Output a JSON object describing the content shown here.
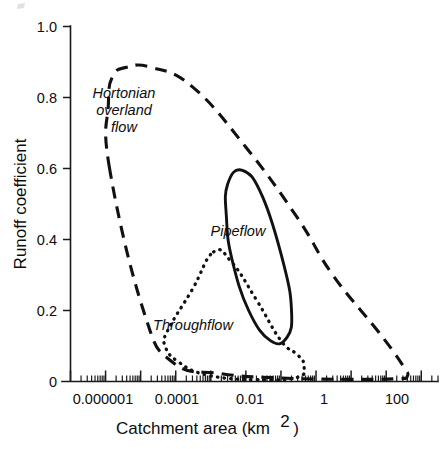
{
  "chart_data": {
    "type": "line",
    "title": "",
    "xlabel": "Catchment area (km2)",
    "xlabel_base": "Catchment area (km",
    "xlabel_sup": "2",
    "xlabel_close": ")",
    "ylabel": "Runoff coefficient",
    "xscale": "log",
    "yscale": "linear",
    "xlim": [
      1e-07,
      3000
    ],
    "ylim": [
      0,
      1.0
    ],
    "grid": false,
    "legend_position": "inline-annotations",
    "xticklabels": [
      "0.000001",
      "0.0001",
      "0.01",
      "1",
      "100"
    ],
    "xtickvalues": [
      1e-06,
      0.0001,
      0.01,
      1,
      100
    ],
    "yticklabels": [
      "1.0",
      "0.8",
      "0.6",
      "0.4",
      "0.2",
      "0"
    ],
    "ytickvalues": [
      1.0,
      0.8,
      0.6,
      0.4,
      0.2,
      0
    ],
    "series": [
      {
        "name": "Hortonian overland flow",
        "linestyle": "dashed",
        "label_lines": [
          "Hortonian",
          "overland",
          "flow"
        ],
        "envelope_points": [
          [
            1.3e-06,
            0.6
          ],
          [
            1.2e-06,
            0.78
          ],
          [
            1.6e-06,
            0.86
          ],
          [
            4e-06,
            0.885
          ],
          [
            2e-05,
            0.885
          ],
          [
            0.0003,
            0.83
          ],
          [
            0.01,
            0.66
          ],
          [
            0.3,
            0.46
          ],
          [
            3.0,
            0.3
          ],
          [
            60,
            0.14
          ],
          [
            300,
            0.045
          ],
          [
            400,
            0.015
          ],
          [
            200,
            0.008
          ],
          [
            10,
            0.006
          ],
          [
            0.1,
            0.01
          ],
          [
            0.002,
            0.022
          ],
          [
            8e-05,
            0.055
          ],
          [
            1.2e-05,
            0.2
          ],
          [
            1.3e-06,
            0.6
          ]
        ]
      },
      {
        "name": "Pipeflow",
        "linestyle": "solid",
        "label_lines": [
          "Pipeflow"
        ],
        "envelope_points": [
          [
            0.003,
            0.555
          ],
          [
            0.008,
            0.595
          ],
          [
            0.03,
            0.52
          ],
          [
            0.12,
            0.33
          ],
          [
            0.2,
            0.2
          ],
          [
            0.15,
            0.125
          ],
          [
            0.05,
            0.115
          ],
          [
            0.012,
            0.2
          ],
          [
            0.004,
            0.345
          ],
          [
            0.0028,
            0.46
          ],
          [
            0.003,
            0.555
          ]
        ]
      },
      {
        "name": "Throughflow",
        "linestyle": "dotted",
        "label_lines": [
          "Throughflow"
        ],
        "envelope_points": [
          [
            0.0012,
            0.365
          ],
          [
            0.004,
            0.335
          ],
          [
            0.02,
            0.23
          ],
          [
            0.1,
            0.115
          ],
          [
            0.3,
            0.075
          ],
          [
            0.45,
            0.045
          ],
          [
            0.3,
            0.012
          ],
          [
            0.02,
            0.005
          ],
          [
            0.0008,
            0.018
          ],
          [
            0.00012,
            0.055
          ],
          [
            5e-05,
            0.1
          ],
          [
            6e-05,
            0.145
          ],
          [
            0.0003,
            0.26
          ],
          [
            0.0012,
            0.365
          ]
        ]
      }
    ]
  },
  "annotations": {
    "hortonian": {
      "line1": "Hortonian",
      "line2": "overland",
      "line3": "flow"
    },
    "pipeflow": {
      "line1": "Pipeflow"
    },
    "throughflow": {
      "line1": "Throughflow"
    }
  },
  "axes": {
    "y_label": "Runoff coefficient",
    "x_label_main": "Catchment area (km",
    "x_label_superscript": "2",
    "x_label_end": ")",
    "y_ticks": [
      {
        "label": "1.0"
      },
      {
        "label": "0.8"
      },
      {
        "label": "0.6"
      },
      {
        "label": "0.4"
      },
      {
        "label": "0.2"
      },
      {
        "label": "0"
      }
    ],
    "x_ticks": [
      {
        "label": "0.000001"
      },
      {
        "label": "0.0001"
      },
      {
        "label": "0.01"
      },
      {
        "label": "1"
      },
      {
        "label": "100"
      }
    ]
  },
  "colors": {
    "ink": "#111111",
    "axis": "#1a1a1a",
    "background": "#ffffff"
  }
}
